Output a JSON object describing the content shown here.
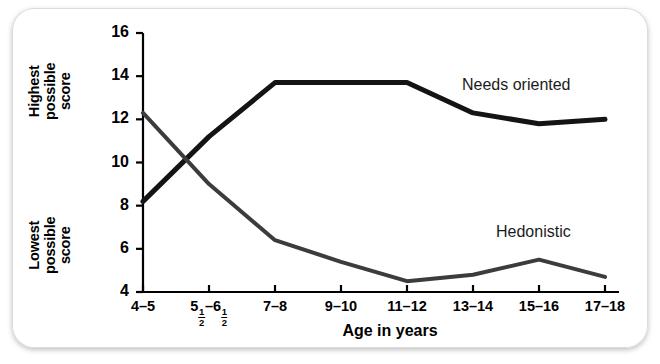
{
  "figure": {
    "y_axis_top_label": "Highest\npossible\nscore",
    "y_axis_bottom_label": "Lowest\npossible\nscore",
    "x_axis_title": "Age in years",
    "series_labels": {
      "needs_oriented": "Needs oriented",
      "hedonistic": "Hedonistic"
    }
  },
  "chart_data": {
    "type": "line",
    "title": "",
    "xlabel": "Age in years",
    "ylabel": "Score",
    "ylim": [
      4,
      16
    ],
    "yticks": [
      4,
      6,
      8,
      10,
      12,
      14,
      16
    ],
    "ytick_labels": [
      "4",
      "6",
      "8",
      "10",
      "12",
      "14",
      "16"
    ],
    "grid": false,
    "legend_position": "inline-annotation",
    "y_axis_top_annotation": "Highest possible score",
    "y_axis_bottom_annotation": "Lowest possible score",
    "categories": [
      "4-5",
      "5 1/2 - 6 1/2",
      "7-8",
      "9-10",
      "11-12",
      "13-14",
      "15-16",
      "17-18"
    ],
    "xtick_labels": [
      "4–5",
      "5½–6½",
      "7–8",
      "9–10",
      "11–12",
      "13–14",
      "15–16",
      "17–18"
    ],
    "series": [
      {
        "name": "Needs oriented",
        "values": [
          8.2,
          11.2,
          13.7,
          13.7,
          13.7,
          12.3,
          11.8,
          12.0
        ],
        "color": "#141414",
        "line_width": 5
      },
      {
        "name": "Hedonistic",
        "values": [
          12.3,
          9.0,
          6.4,
          5.4,
          4.5,
          4.8,
          5.5,
          4.7
        ],
        "color": "#3c3c3c",
        "line_width": 4
      }
    ]
  },
  "ticks_x_fraction_label": {
    "prefix": "5",
    "num1": "1",
    "den1": "2",
    "mid": "–6",
    "num2": "1",
    "den2": "2"
  }
}
